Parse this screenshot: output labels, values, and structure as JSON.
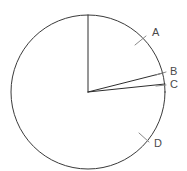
{
  "figure": {
    "kind": "circle-sector-diagram",
    "background_color": "#ffffff",
    "stroke_color": "#3a3a3a",
    "leader_color": "#8a8a8a",
    "label_color": "#4a4a4a"
  },
  "chart_data": {
    "type": "pie",
    "title": "",
    "subtitle": "",
    "xlabel": "",
    "ylabel": "",
    "grid": false,
    "legend_position": "inline-annotations",
    "center": {
      "x": 88,
      "y": 92
    },
    "radius": 77,
    "start_angle_deg": 90,
    "direction": "clockwise",
    "categories": [
      "A",
      "B",
      "C",
      "D"
    ],
    "values": [
      76,
      8,
      5,
      271
    ],
    "angles_deg": [
      76,
      8,
      5,
      271
    ],
    "boundary_angles_deg": [
      90,
      14,
      6,
      1
    ],
    "labels": [
      {
        "name": "A",
        "text": "A",
        "x": 152,
        "y": 33,
        "tick_from": {
          "x": 135,
          "y": 45
        },
        "tick_to": {
          "x": 146,
          "y": 36
        }
      },
      {
        "name": "B",
        "text": "B",
        "x": 170,
        "y": 72,
        "tick_from": {
          "x": 156,
          "y": 75
        },
        "tick_to": {
          "x": 166,
          "y": 72
        }
      },
      {
        "name": "C",
        "text": "C",
        "x": 170,
        "y": 85,
        "tick_from": {
          "x": 156,
          "y": 86
        },
        "tick_to": {
          "x": 166,
          "y": 85
        }
      },
      {
        "name": "D",
        "text": "D",
        "x": 154,
        "y": 144,
        "tick_from": {
          "x": 139,
          "y": 133
        },
        "tick_to": {
          "x": 149,
          "y": 142
        }
      }
    ],
    "radii_endpoints": [
      {
        "name": "radius-top",
        "x": 88,
        "y": 15
      },
      {
        "name": "radius-b",
        "x": 163,
        "y": 73
      },
      {
        "name": "radius-c",
        "x": 165,
        "y": 84
      }
    ]
  }
}
